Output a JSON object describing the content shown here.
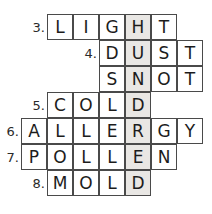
{
  "puzzle": {
    "type": "crossword-word-fit",
    "cell_size": 26,
    "origin_x": 21,
    "origin_y": 14,
    "shaded_column": 4,
    "shaded_color": "#e9e7e4",
    "grid_border_color": "#4a4a4a",
    "cell_background": "#ffffff",
    "background": "#ffffff",
    "hidden_word": "HUNDRED",
    "rows": [
      {
        "number": "3.",
        "answer": "LIGHT",
        "start_col": 1,
        "letters": [
          "L",
          "I",
          "G",
          "H",
          "T"
        ]
      },
      {
        "number": "4.",
        "answer": "DUST",
        "start_col": 3,
        "letters": [
          "D",
          "U",
          "S",
          "T"
        ]
      },
      {
        "number": "",
        "answer": "SNOT",
        "start_col": 3,
        "letters": [
          "S",
          "N",
          "O",
          "T"
        ]
      },
      {
        "number": "5.",
        "answer": "COLD",
        "start_col": 1,
        "letters": [
          "C",
          "O",
          "L",
          "D"
        ]
      },
      {
        "number": "6.",
        "answer": "ALLERGY",
        "start_col": 0,
        "letters": [
          "A",
          "L",
          "L",
          "E",
          "R",
          "G",
          "Y"
        ]
      },
      {
        "number": "7.",
        "answer": "POLLEN",
        "start_col": 0,
        "letters": [
          "P",
          "O",
          "L",
          "L",
          "E",
          "N"
        ]
      },
      {
        "number": "8.",
        "answer": "MOLD",
        "start_col": 1,
        "letters": [
          "M",
          "O",
          "L",
          "D"
        ]
      }
    ]
  }
}
